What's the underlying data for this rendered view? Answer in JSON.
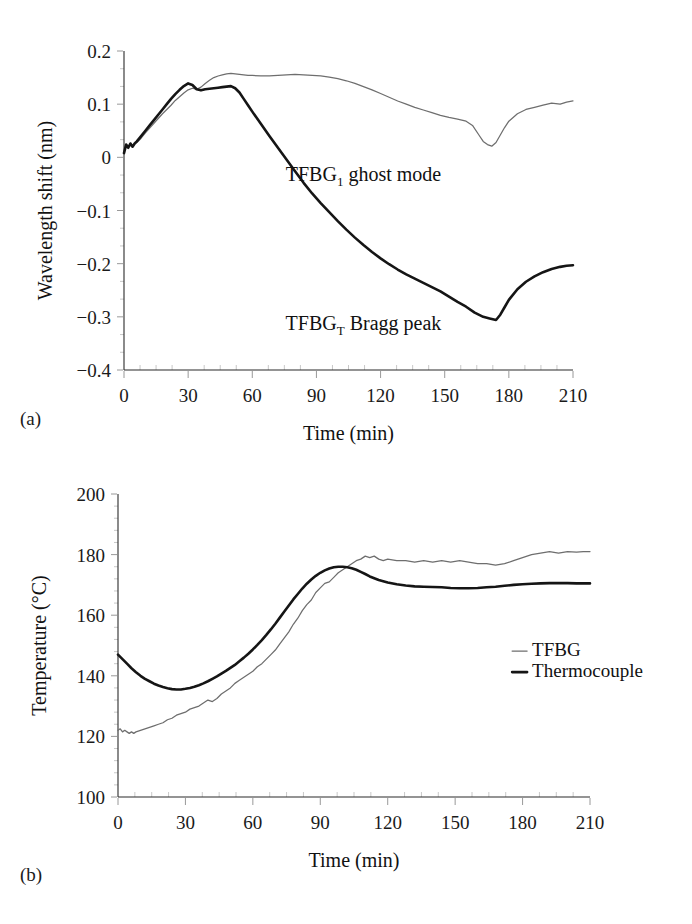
{
  "figure": {
    "panel_a_label": "(a)",
    "panel_b_label": "(b)"
  },
  "chart_data": [
    {
      "id": "panel-a",
      "type": "line",
      "title": "",
      "xlabel": "Time (min)",
      "ylabel": "Wavelength shift (nm)",
      "xlim": [
        0,
        210
      ],
      "ylim": [
        -0.4,
        0.2
      ],
      "xticks": [
        0,
        30,
        60,
        90,
        120,
        150,
        180,
        210
      ],
      "xticklabels": [
        "0",
        "30",
        "60",
        "90",
        "120",
        "150",
        "180",
        "210"
      ],
      "yticks": [
        0.2,
        0.1,
        0,
        -0.1,
        -0.2,
        -0.3,
        -0.4
      ],
      "yticklabels": [
        "0.2",
        "0.1",
        "0",
        "−0.1",
        "−0.2",
        "−0.3",
        "−0.4"
      ],
      "minor_xticks_per_interval": 3,
      "minor_yticks_per_interval": 2,
      "grid": false,
      "legend": "none",
      "annotations": [
        {
          "name": "ghost-mode-label",
          "base": "TFBG",
          "sub": "1",
          "tail": " ghost mode",
          "x": 112,
          "y": -0.045
        },
        {
          "name": "bragg-peak-label",
          "base": "TFBG",
          "sub": "T",
          "tail": " Bragg peak",
          "x": 112,
          "y": -0.325
        }
      ],
      "series": [
        {
          "name": "TFBG1 ghost mode",
          "style": "thin",
          "color": "#6e6e6e",
          "x": [
            0,
            1,
            2,
            3,
            4,
            5,
            6,
            8,
            10,
            12,
            14,
            16,
            18,
            20,
            22,
            24,
            26,
            28,
            30,
            32,
            34,
            36,
            38,
            40,
            42,
            44,
            46,
            48,
            50,
            52,
            54,
            56,
            58,
            60,
            64,
            68,
            72,
            76,
            80,
            84,
            88,
            92,
            96,
            100,
            104,
            108,
            112,
            116,
            120,
            124,
            128,
            132,
            136,
            140,
            144,
            148,
            152,
            156,
            160,
            163,
            166,
            168,
            170,
            172,
            174,
            176,
            178,
            180,
            184,
            188,
            192,
            196,
            200,
            204,
            207,
            210
          ],
          "y": [
            0.01,
            0.024,
            0.02,
            0.026,
            0.022,
            0.026,
            0.028,
            0.036,
            0.046,
            0.055,
            0.064,
            0.073,
            0.082,
            0.09,
            0.098,
            0.107,
            0.114,
            0.121,
            0.127,
            0.13,
            0.128,
            0.132,
            0.139,
            0.145,
            0.15,
            0.153,
            0.155,
            0.157,
            0.158,
            0.157,
            0.156,
            0.155,
            0.154,
            0.154,
            0.153,
            0.153,
            0.154,
            0.155,
            0.156,
            0.155,
            0.154,
            0.153,
            0.151,
            0.148,
            0.144,
            0.139,
            0.133,
            0.127,
            0.12,
            0.113,
            0.106,
            0.1,
            0.094,
            0.089,
            0.084,
            0.079,
            0.075,
            0.072,
            0.068,
            0.06,
            0.042,
            0.03,
            0.024,
            0.021,
            0.028,
            0.042,
            0.056,
            0.068,
            0.082,
            0.09,
            0.094,
            0.098,
            0.102,
            0.1,
            0.104,
            0.106
          ]
        },
        {
          "name": "TFBGT Bragg peak",
          "style": "thick",
          "color": "#151515",
          "x": [
            0,
            1,
            2,
            3,
            4,
            5,
            6,
            8,
            10,
            12,
            14,
            16,
            18,
            20,
            22,
            24,
            26,
            28,
            30,
            32,
            34,
            36,
            38,
            40,
            42,
            44,
            46,
            48,
            50,
            52,
            54,
            56,
            58,
            60,
            64,
            68,
            72,
            76,
            80,
            84,
            88,
            92,
            96,
            100,
            104,
            108,
            112,
            116,
            120,
            124,
            128,
            132,
            136,
            140,
            144,
            148,
            152,
            156,
            160,
            164,
            168,
            171,
            174,
            176,
            178,
            180,
            184,
            188,
            192,
            196,
            200,
            204,
            207,
            210
          ],
          "y": [
            0.008,
            0.024,
            0.018,
            0.026,
            0.02,
            0.026,
            0.03,
            0.04,
            0.05,
            0.06,
            0.07,
            0.08,
            0.09,
            0.1,
            0.11,
            0.119,
            0.127,
            0.134,
            0.139,
            0.136,
            0.128,
            0.126,
            0.128,
            0.129,
            0.13,
            0.131,
            0.132,
            0.133,
            0.134,
            0.13,
            0.122,
            0.11,
            0.098,
            0.086,
            0.063,
            0.04,
            0.018,
            -0.004,
            -0.026,
            -0.048,
            -0.068,
            -0.086,
            -0.103,
            -0.12,
            -0.136,
            -0.151,
            -0.165,
            -0.178,
            -0.19,
            -0.201,
            -0.211,
            -0.22,
            -0.228,
            -0.236,
            -0.244,
            -0.252,
            -0.262,
            -0.272,
            -0.281,
            -0.292,
            -0.3,
            -0.303,
            -0.306,
            -0.296,
            -0.282,
            -0.268,
            -0.248,
            -0.234,
            -0.224,
            -0.216,
            -0.21,
            -0.206,
            -0.204,
            -0.203
          ]
        }
      ]
    },
    {
      "id": "panel-b",
      "type": "line",
      "title": "",
      "xlabel": "Time (min)",
      "ylabel": "Temperature (°C)",
      "xlim": [
        0,
        210
      ],
      "ylim": [
        100,
        200
      ],
      "xticks": [
        0,
        30,
        60,
        90,
        120,
        150,
        180,
        210
      ],
      "xticklabels": [
        "0",
        "30",
        "60",
        "90",
        "120",
        "150",
        "180",
        "210"
      ],
      "yticks": [
        200,
        180,
        160,
        140,
        120,
        100
      ],
      "yticklabels": [
        "200",
        "180",
        "160",
        "140",
        "120",
        "100"
      ],
      "minor_xticks_per_interval": 3,
      "minor_yticks_per_interval": 4,
      "grid": false,
      "legend": "inside-right",
      "legend_items": [
        {
          "label": "TFBG",
          "style": "thin",
          "color": "#6e6e6e"
        },
        {
          "label": "Thermocouple",
          "style": "thick",
          "color": "#151515"
        }
      ],
      "series": [
        {
          "name": "TFBG",
          "style": "thin",
          "color": "#6e6e6e",
          "x": [
            0,
            1,
            2,
            3,
            4,
            5,
            6,
            7,
            8,
            10,
            12,
            14,
            16,
            18,
            20,
            22,
            24,
            26,
            28,
            30,
            32,
            34,
            36,
            38,
            40,
            42,
            44,
            46,
            48,
            50,
            52,
            54,
            56,
            58,
            60,
            62,
            64,
            66,
            68,
            70,
            72,
            74,
            76,
            78,
            80,
            82,
            84,
            86,
            88,
            90,
            92,
            94,
            96,
            98,
            100,
            102,
            104,
            106,
            108,
            110,
            112,
            114,
            116,
            118,
            120,
            124,
            128,
            132,
            136,
            140,
            144,
            148,
            152,
            156,
            160,
            164,
            168,
            172,
            176,
            180,
            184,
            188,
            192,
            196,
            200,
            204,
            207,
            210
          ],
          "y": [
            122,
            122.5,
            121.5,
            122,
            121.5,
            121,
            121.5,
            121,
            121.5,
            122,
            122.5,
            123,
            123.5,
            124,
            124.5,
            125.5,
            126,
            127,
            127.5,
            128,
            129,
            129.5,
            130,
            131,
            132,
            131.5,
            132.5,
            134,
            135,
            136,
            137.5,
            138.5,
            139.5,
            140.5,
            141.5,
            143,
            144,
            145.5,
            147,
            148.5,
            150.5,
            152.5,
            154.5,
            157,
            159,
            161.5,
            163.5,
            165,
            167.5,
            169,
            170.5,
            171,
            172.5,
            174,
            175,
            176,
            177,
            178,
            178.5,
            179.5,
            179,
            179.5,
            178.5,
            178,
            178.5,
            178,
            178,
            177.5,
            178,
            177.5,
            178,
            177.5,
            178,
            177.5,
            177,
            177,
            176.5,
            177,
            178,
            179,
            180,
            180.5,
            181,
            180.5,
            181,
            180.8,
            181,
            181
          ]
        },
        {
          "name": "Thermocouple",
          "style": "thick",
          "color": "#151515",
          "x": [
            0,
            2,
            4,
            6,
            8,
            10,
            12,
            14,
            16,
            18,
            20,
            22,
            24,
            26,
            28,
            30,
            32,
            34,
            36,
            38,
            40,
            42,
            44,
            46,
            48,
            50,
            52,
            54,
            56,
            58,
            60,
            62,
            64,
            66,
            68,
            70,
            72,
            74,
            76,
            78,
            80,
            82,
            84,
            86,
            88,
            90,
            92,
            94,
            96,
            98,
            100,
            102,
            104,
            106,
            108,
            110,
            112,
            114,
            116,
            118,
            120,
            124,
            128,
            132,
            136,
            140,
            144,
            148,
            152,
            156,
            160,
            164,
            168,
            172,
            176,
            180,
            184,
            188,
            192,
            196,
            200,
            204,
            207,
            210
          ],
          "y": [
            147,
            145.5,
            144,
            142.5,
            141.2,
            140,
            139,
            138.2,
            137.4,
            136.8,
            136.3,
            135.9,
            135.6,
            135.5,
            135.5,
            135.7,
            136,
            136.4,
            136.9,
            137.5,
            138.2,
            139,
            139.8,
            140.7,
            141.6,
            142.6,
            143.6,
            144.8,
            146,
            147.3,
            148.7,
            150.2,
            151.8,
            153.5,
            155.3,
            157.2,
            159.2,
            161.2,
            163.2,
            165.2,
            167,
            168.8,
            170.4,
            171.8,
            173,
            174,
            174.8,
            175.4,
            175.8,
            176,
            176,
            175.8,
            175.5,
            175,
            174.3,
            173.6,
            172.8,
            172.2,
            171.6,
            171.2,
            170.8,
            170.2,
            169.8,
            169.5,
            169.4,
            169.3,
            169.2,
            169,
            168.9,
            168.9,
            169,
            169.2,
            169.4,
            169.7,
            170,
            170.2,
            170.4,
            170.5,
            170.6,
            170.6,
            170.6,
            170.5,
            170.5,
            170.5
          ]
        }
      ]
    }
  ]
}
